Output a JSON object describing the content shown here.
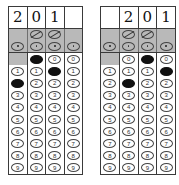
{
  "document": {
    "type": "gridded-answer-sheet",
    "description": "Two student-produced response grids, each with a handwritten answer row, a shaded fraction-bar/decimal-point band, and columns of numeric bubbles 0-9",
    "columns_per_grid": 4,
    "digit_rows": [
      "0",
      "1",
      "2",
      "3",
      "4",
      "5",
      "6",
      "7",
      "8",
      "9"
    ],
    "symbols": {
      "fraction_bar": "/",
      "decimal_point": "."
    },
    "colors": {
      "paper": "#ffffff",
      "shaded_band": "#b9b9b9",
      "rule": "#3a3a3a",
      "bubble_outline": "#444444",
      "bubble_filled": "#111111"
    }
  },
  "grids": [
    {
      "name": "answer-grid-left",
      "handwritten": [
        "2",
        "0",
        "1",
        ""
      ],
      "band": {
        "slash": [
          false,
          true,
          true,
          false
        ],
        "dot": [
          true,
          true,
          true,
          true
        ]
      },
      "columns": [
        {
          "name": "column-1",
          "zero_slot": "blocked",
          "marked": "2",
          "bubbles": [
            "",
            "1",
            "2",
            "3",
            "4",
            "5",
            "6",
            "7",
            "8",
            "9"
          ]
        },
        {
          "name": "column-2",
          "zero_slot": "open",
          "marked": "0",
          "bubbles": [
            "0",
            "1",
            "2",
            "3",
            "4",
            "5",
            "6",
            "7",
            "8",
            "9"
          ]
        },
        {
          "name": "column-3",
          "zero_slot": "open",
          "marked": "1",
          "bubbles": [
            "0",
            "1",
            "2",
            "3",
            "4",
            "5",
            "6",
            "7",
            "8",
            "9"
          ]
        },
        {
          "name": "column-4",
          "zero_slot": "open",
          "marked": "",
          "bubbles": [
            "0",
            "1",
            "2",
            "3",
            "4",
            "5",
            "6",
            "7",
            "8",
            "9"
          ]
        }
      ]
    },
    {
      "name": "answer-grid-right",
      "handwritten": [
        "",
        "2",
        "0",
        "1"
      ],
      "band": {
        "slash": [
          false,
          true,
          true,
          false
        ],
        "dot": [
          true,
          true,
          true,
          true
        ]
      },
      "columns": [
        {
          "name": "column-1",
          "zero_slot": "blocked",
          "marked": "",
          "bubbles": [
            "",
            "1",
            "2",
            "3",
            "4",
            "5",
            "6",
            "7",
            "8",
            "9"
          ]
        },
        {
          "name": "column-2",
          "zero_slot": "open",
          "marked": "2",
          "bubbles": [
            "0",
            "1",
            "2",
            "3",
            "4",
            "5",
            "6",
            "7",
            "8",
            "9"
          ]
        },
        {
          "name": "column-3",
          "zero_slot": "open",
          "marked": "0",
          "bubbles": [
            "0",
            "1",
            "2",
            "3",
            "4",
            "5",
            "6",
            "7",
            "8",
            "9"
          ]
        },
        {
          "name": "column-4",
          "zero_slot": "open",
          "marked": "1",
          "bubbles": [
            "0",
            "1",
            "2",
            "3",
            "4",
            "5",
            "6",
            "7",
            "8",
            "9"
          ]
        }
      ]
    }
  ]
}
